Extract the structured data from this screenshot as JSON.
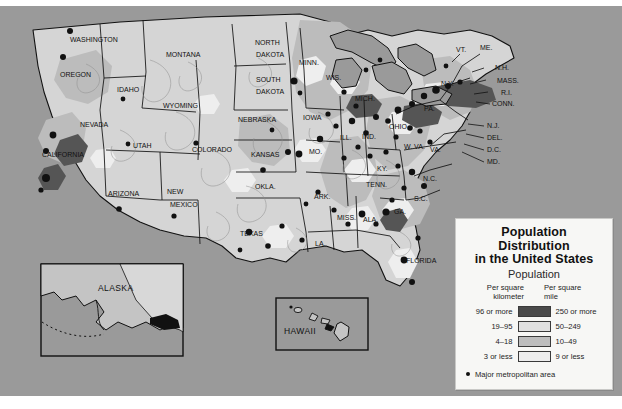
{
  "map": {
    "title": "Population Distribution in the United States",
    "background_color": "#9a9a9a",
    "insets": [
      {
        "name": "alaska",
        "label": "ALASKA"
      },
      {
        "name": "hawaii",
        "label": "HAWAII"
      }
    ],
    "state_labels": [
      {
        "label": "WASHINGTON",
        "x": 70,
        "y": 42
      },
      {
        "label": "OREGON",
        "x": 60,
        "y": 77
      },
      {
        "label": "IDAHO",
        "x": 117,
        "y": 92
      },
      {
        "label": "MONTANA",
        "x": 166,
        "y": 57
      },
      {
        "label": "WYOMING",
        "x": 163,
        "y": 108
      },
      {
        "label": "NEVADA",
        "x": 80,
        "y": 127
      },
      {
        "label": "UTAH",
        "x": 133,
        "y": 148
      },
      {
        "label": "CALIFORNIA",
        "x": 42,
        "y": 157
      },
      {
        "label": "ARIZONA",
        "x": 108,
        "y": 196
      },
      {
        "label": "NEW",
        "x": 167,
        "y": 194
      },
      {
        "label": "MEXICO",
        "x": 170,
        "y": 207
      },
      {
        "label": "COLORADO",
        "x": 192,
        "y": 152
      },
      {
        "label": "NORTH",
        "x": 255,
        "y": 45
      },
      {
        "label": "DAKOTA",
        "x": 256,
        "y": 57
      },
      {
        "label": "SOUTH",
        "x": 256,
        "y": 82
      },
      {
        "label": "DAKOTA",
        "x": 256,
        "y": 94
      },
      {
        "label": "NEBRASKA",
        "x": 238,
        "y": 122
      },
      {
        "label": "KANSAS",
        "x": 251,
        "y": 157
      },
      {
        "label": "OKLA.",
        "x": 255,
        "y": 189
      },
      {
        "label": "TEXAS",
        "x": 240,
        "y": 236
      },
      {
        "label": "MINN.",
        "x": 299,
        "y": 65
      },
      {
        "label": "IOWA",
        "x": 303,
        "y": 120
      },
      {
        "label": "MO.",
        "x": 309,
        "y": 154
      },
      {
        "label": "ARK.",
        "x": 314,
        "y": 199
      },
      {
        "label": "LA.",
        "x": 315,
        "y": 246
      },
      {
        "label": "MISS.",
        "x": 337,
        "y": 220
      },
      {
        "label": "ALA.",
        "x": 363,
        "y": 222
      },
      {
        "label": "WIS.",
        "x": 326,
        "y": 80
      },
      {
        "label": "ILL.",
        "x": 340,
        "y": 140
      },
      {
        "label": "IND.",
        "x": 362,
        "y": 139
      },
      {
        "label": "MICH.",
        "x": 355,
        "y": 101
      },
      {
        "label": "OHIO",
        "x": 389,
        "y": 129
      },
      {
        "label": "KY.",
        "x": 377,
        "y": 171
      },
      {
        "label": "TENN.",
        "x": 366,
        "y": 187
      },
      {
        "label": "GA.",
        "x": 394,
        "y": 214
      },
      {
        "label": "FLORIDA",
        "x": 406,
        "y": 263
      },
      {
        "label": "S.C.",
        "x": 414,
        "y": 201
      },
      {
        "label": "N.C.",
        "x": 423,
        "y": 181
      },
      {
        "label": "W. VA.",
        "x": 404,
        "y": 149
      },
      {
        "label": "VA.",
        "x": 430,
        "y": 152
      },
      {
        "label": "PA.",
        "x": 424,
        "y": 111
      },
      {
        "label": "N.Y.",
        "x": 441,
        "y": 86
      },
      {
        "label": "VT.",
        "x": 456,
        "y": 52
      },
      {
        "label": "ME.",
        "x": 480,
        "y": 50
      },
      {
        "label": "N.H.",
        "x": 495,
        "y": 70
      },
      {
        "label": "MASS.",
        "x": 497,
        "y": 83
      },
      {
        "label": "R.I.",
        "x": 501,
        "y": 95
      },
      {
        "label": "CONN.",
        "x": 492,
        "y": 106
      },
      {
        "label": "N.J.",
        "x": 487,
        "y": 128
      },
      {
        "label": "DEL.",
        "x": 487,
        "y": 140
      },
      {
        "label": "D.C.",
        "x": 487,
        "y": 152
      },
      {
        "label": "MD.",
        "x": 487,
        "y": 164
      }
    ]
  },
  "legend": {
    "title_line1": "Population",
    "title_line2": "Distribution",
    "title_line3": "in the United States",
    "subtitle": "Population",
    "header_left": "Per square\nkilometer",
    "header_left_l1": "Per square",
    "header_left_l2": "kilometer",
    "header_right_l1": "Per square",
    "header_right_l2": "mile",
    "rows": [
      {
        "left": "96 or more",
        "right": "250 or more",
        "color": "#4a4a4a"
      },
      {
        "left": "19–95",
        "right": "50–249",
        "color": "#e0e0e0"
      },
      {
        "left": "4–18",
        "right": "10–49",
        "color": "#bdbdbd"
      },
      {
        "left": "3 or less",
        "right": "9 or less",
        "color": "#ededed"
      }
    ],
    "footnote": "Major metropolitan area",
    "footnote_marker": "dot"
  }
}
